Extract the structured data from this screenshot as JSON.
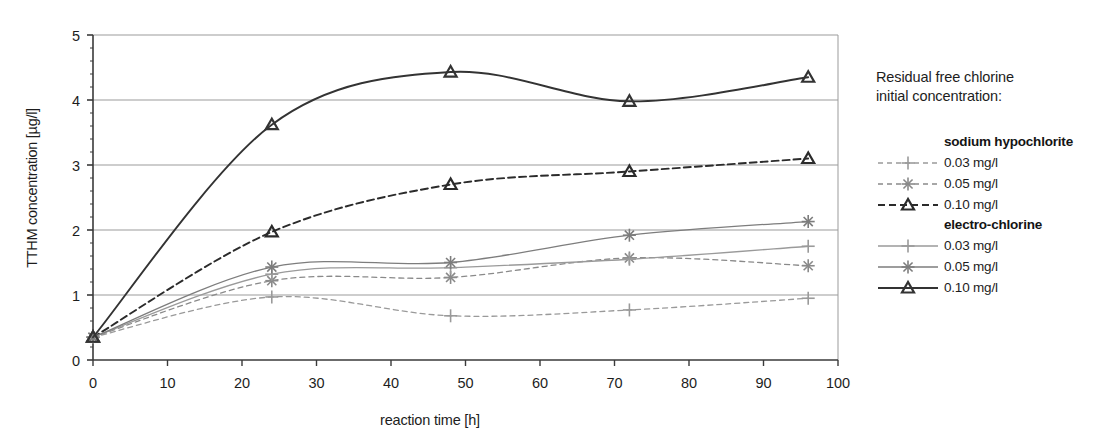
{
  "chart_data": {
    "type": "line",
    "title": "",
    "xlabel": "reaction time [h]",
    "ylabel": "TTHM concentration [µg/l]",
    "xlim": [
      0,
      100
    ],
    "ylim": [
      0,
      5
    ],
    "xticks": [
      0,
      10,
      20,
      30,
      40,
      50,
      60,
      70,
      80,
      90,
      100
    ],
    "yticks": [
      0,
      1,
      2,
      3,
      4,
      5
    ],
    "xtick_labels": [
      "0",
      "10",
      "20",
      "30",
      "40",
      "50",
      "60",
      "70",
      "80",
      "90",
      "100"
    ],
    "ytick_labels": [
      "0",
      "1",
      "2",
      "3",
      "4",
      "5"
    ],
    "grid": "horizontal",
    "legend_position": "right",
    "x": [
      0,
      24,
      48,
      72,
      96
    ],
    "series": [
      {
        "name": "sodium hypochlorite 0.03 mg/l",
        "group": "sodium hypochlorite",
        "label": "0.03 mg/l",
        "linestyle": "dashed",
        "marker": "plus",
        "color": "#9a9a9a",
        "values": [
          0.35,
          0.97,
          0.68,
          0.77,
          0.95
        ]
      },
      {
        "name": "sodium hypochlorite 0.05 mg/l",
        "group": "sodium hypochlorite",
        "label": "0.05 mg/l",
        "linestyle": "dashed",
        "marker": "asterisk",
        "color": "#8a8a8a",
        "values": [
          0.35,
          1.22,
          1.27,
          1.57,
          1.45
        ]
      },
      {
        "name": "sodium hypochlorite 0.10 mg/l",
        "group": "sodium hypochlorite",
        "label": "0.10 mg/l",
        "linestyle": "dashed",
        "marker": "triangle",
        "color": "#2b2b2b",
        "values": [
          0.35,
          1.97,
          2.7,
          2.9,
          3.1
        ]
      },
      {
        "name": "electro-chlorine 0.03 mg/l",
        "group": "electro-chlorine",
        "label": "0.03 mg/l",
        "linestyle": "solid",
        "marker": "plus",
        "color": "#9a9a9a",
        "values": [
          0.35,
          1.32,
          1.42,
          1.55,
          1.75
        ]
      },
      {
        "name": "electro-chlorine 0.05 mg/l",
        "group": "electro-chlorine",
        "label": "0.05 mg/l",
        "linestyle": "solid",
        "marker": "asterisk",
        "color": "#7d7d7d",
        "values": [
          0.35,
          1.43,
          1.5,
          1.92,
          2.13
        ]
      },
      {
        "name": "electro-chlorine 0.10 mg/l",
        "group": "electro-chlorine",
        "label": "0.10 mg/l",
        "linestyle": "solid",
        "marker": "triangle",
        "color": "#333333",
        "values": [
          0.35,
          3.62,
          4.43,
          3.98,
          4.35
        ]
      }
    ]
  },
  "legend": {
    "title": "Residual free chlorine\ninitial concentration:",
    "groups": [
      {
        "label": "sodium hypochlorite",
        "items": [
          {
            "label": "0.03 mg/l",
            "series_index": 0
          },
          {
            "label": "0.05 mg/l",
            "series_index": 1
          },
          {
            "label": "0.10 mg/l",
            "series_index": 2
          }
        ]
      },
      {
        "label": "electro-chlorine",
        "items": [
          {
            "label": "0.03 mg/l",
            "series_index": 3
          },
          {
            "label": "0.05 mg/l",
            "series_index": 4
          },
          {
            "label": "0.10 mg/l",
            "series_index": 5
          }
        ]
      }
    ]
  },
  "axes": {
    "x_title": "reaction time [h]",
    "y_title": "TTHM concentration [µg/l]"
  }
}
